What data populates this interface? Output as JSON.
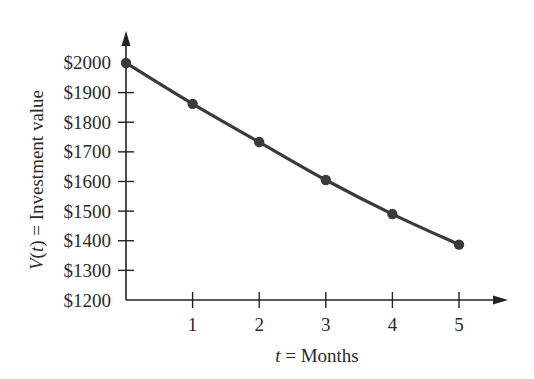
{
  "chart_data": {
    "type": "line",
    "title": "",
    "xlabel": "t = Months",
    "xlabel_parts": {
      "var": "t",
      "rest": " = Months"
    },
    "ylabel": "V(t) = Investment value",
    "ylabel_parts": {
      "var": "V",
      "open": "(",
      "arg": "t",
      "close": ")",
      "rest": " = Investment value"
    },
    "x": [
      0,
      1,
      2,
      3,
      4,
      5
    ],
    "series": [
      {
        "name": "V(t)",
        "values": [
          2000,
          1862,
          1733,
          1605,
          1490,
          1387
        ],
        "color": "#3a3a3a",
        "markers": true
      }
    ],
    "xticks": [
      1,
      2,
      3,
      4,
      5
    ],
    "xtick_labels": [
      "1",
      "2",
      "3",
      "4",
      "5"
    ],
    "yticks": [
      1200,
      1300,
      1400,
      1500,
      1600,
      1700,
      1800,
      1900,
      2000
    ],
    "ytick_labels": [
      "$1200",
      "$1300",
      "$1400",
      "$1500",
      "$1600",
      "$1700",
      "$1800",
      "$1900",
      "$2000"
    ],
    "xlim": [
      0,
      5.6
    ],
    "ylim": [
      1200,
      2100
    ],
    "grid": false,
    "legend": "none",
    "colors": {
      "axis": "#222222",
      "line": "#3a3a3a",
      "marker": "#3a3a3a",
      "text": "#2a2a2a"
    }
  }
}
